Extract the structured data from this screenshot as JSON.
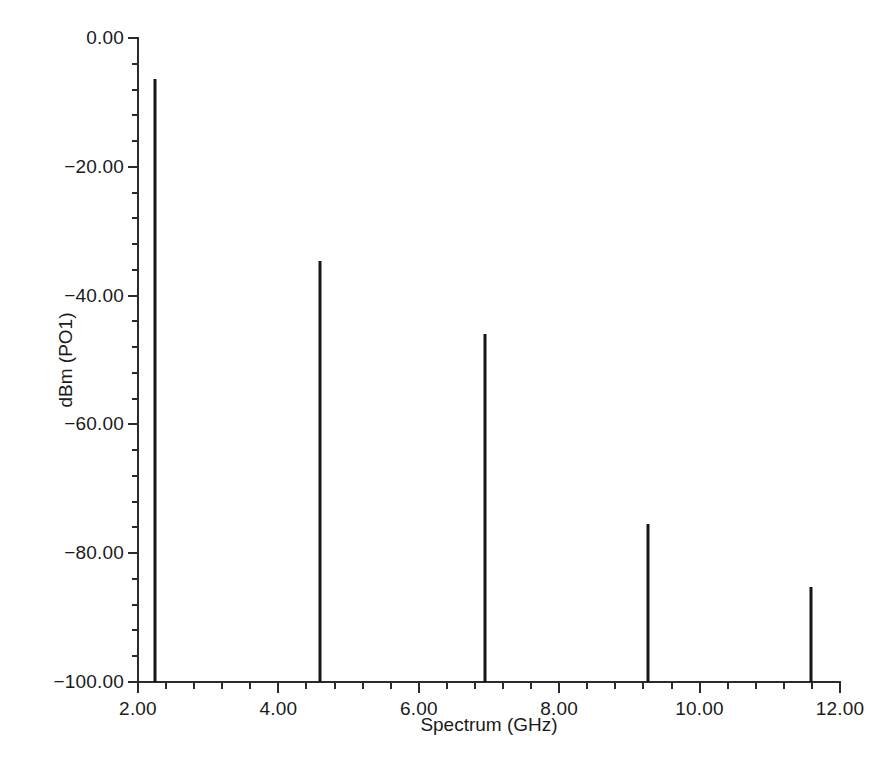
{
  "chart_data": {
    "type": "bar",
    "title": "",
    "subtitle": "",
    "xlabel": "Spectrum (GHz)",
    "ylabel": "dBm (PO1)",
    "xlim": [
      2.0,
      12.0
    ],
    "ylim": [
      -100.0,
      0.0
    ],
    "grid": false,
    "legend": null,
    "x_major_ticks": [
      2.0,
      4.0,
      6.0,
      8.0,
      10.0,
      12.0
    ],
    "x_tick_labels": [
      "2.00",
      "4.00",
      "6.00",
      "8.00",
      "10.00",
      "12.00"
    ],
    "x_minor_step": 0.4,
    "y_major_ticks": [
      0.0,
      -20.0,
      -40.0,
      -60.0,
      -80.0,
      -100.0
    ],
    "y_tick_labels": [
      "0.00",
      "-20.00",
      "-40.00",
      "-60.00",
      "-80.00",
      "-100.00"
    ],
    "y_minor_step": 4.0,
    "baseline": -100.0,
    "series": [
      {
        "name": "Harmonics",
        "color": "#161616",
        "x": [
          2.24,
          4.59,
          6.94,
          9.27,
          11.58
        ],
        "values": [
          -6.4,
          -34.6,
          -46.0,
          -75.5,
          -85.3
        ]
      }
    ],
    "points": [
      {
        "label": "fundamental",
        "x": 2.24,
        "y": -6.4
      },
      {
        "label": "2nd harmonic",
        "x": 4.59,
        "y": -34.6
      },
      {
        "label": "3rd harmonic",
        "x": 6.94,
        "y": -46.0
      },
      {
        "label": "4th harmonic",
        "x": 9.27,
        "y": -75.5
      },
      {
        "label": "5th harmonic",
        "x": 11.58,
        "y": -85.3
      }
    ]
  },
  "axes": {
    "x_title": "Spectrum (GHz)",
    "y_title": "dBm (PO1)"
  },
  "colors": {
    "background": "#ffffff",
    "axis": "#2b2b2b",
    "trace": "#161616",
    "text": "#1a1a1a"
  }
}
